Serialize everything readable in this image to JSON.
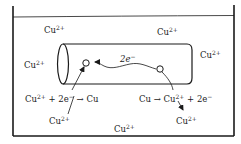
{
  "diagram": {
    "title": "",
    "colors": {
      "ink": "#1a1a1a",
      "background": "#ffffff"
    },
    "ions": [
      {
        "id": "ion-top-left",
        "symbol": "Cu",
        "charge": "2+",
        "x": 44,
        "y": 25
      },
      {
        "id": "ion-top-right",
        "symbol": "Cu",
        "charge": "2+",
        "x": 157,
        "y": 27
      },
      {
        "id": "ion-left",
        "symbol": "Cu",
        "charge": "2+",
        "x": 24,
        "y": 60
      },
      {
        "id": "ion-right",
        "symbol": "Cu",
        "charge": "2+",
        "x": 200,
        "y": 50
      },
      {
        "id": "ion-bottom-left",
        "symbol": "Cu",
        "charge": "2+",
        "x": 49,
        "y": 116
      },
      {
        "id": "ion-bottom-center",
        "symbol": "Cu",
        "charge": "2+",
        "x": 114,
        "y": 124
      },
      {
        "id": "ion-bottom-right",
        "symbol": "Cu",
        "charge": "2+",
        "x": 176,
        "y": 116
      }
    ],
    "electron_label": {
      "text": "2e",
      "superscript": "−",
      "x": 120,
      "y": 54
    },
    "reactions": {
      "reduction": {
        "lhs_ion": "Cu",
        "lhs_charge": "2+",
        "middle": " + 2e",
        "electron_charge": "−",
        "arrow": " → ",
        "product": "Cu",
        "x": 25,
        "y": 94
      },
      "oxidation": {
        "reactant": "Cu",
        "arrow": " → ",
        "ion": "Cu",
        "ion_charge": "2+",
        "tail": " + 2e",
        "electron_charge": "−",
        "x": 139,
        "y": 94
      }
    },
    "rod": {
      "label": "",
      "x1": 57,
      "x2": 192,
      "y_top": 44,
      "y_bottom": 84
    },
    "sites": [
      {
        "id": "cathode-site",
        "x": 86,
        "y": 63
      },
      {
        "id": "anode-site",
        "x": 160,
        "y": 69
      }
    ]
  }
}
